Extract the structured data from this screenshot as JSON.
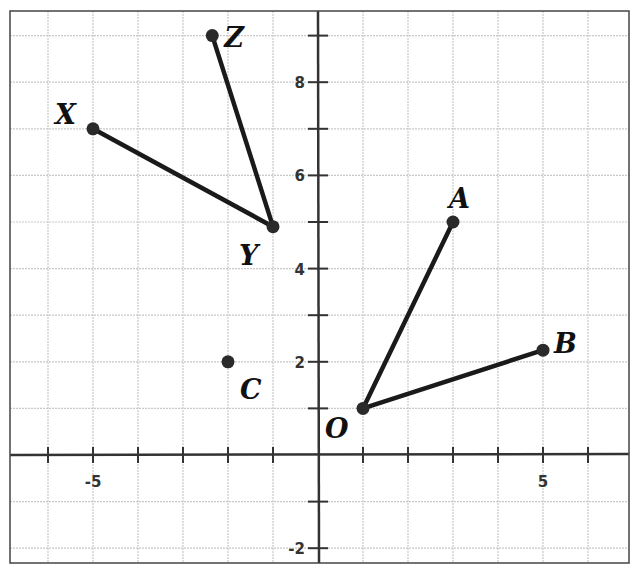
{
  "diagram": {
    "type": "coordinate-plane",
    "x_range": [
      -6.9,
      6.9
    ],
    "y_range": [
      -2.3,
      9.8
    ],
    "grid_step": 1,
    "axis_labels": {
      "x_ticks": [
        {
          "value": -5,
          "label": "-5"
        },
        {
          "value": 5,
          "label": "5"
        }
      ],
      "y_ticks": [
        {
          "value": 8,
          "label": "8"
        },
        {
          "value": 6,
          "label": "6"
        },
        {
          "value": 4,
          "label": "4"
        },
        {
          "value": 2,
          "label": "2"
        },
        {
          "value": -2,
          "label": "-2"
        }
      ]
    },
    "points": [
      {
        "name": "X",
        "x": -5,
        "y": 7
      },
      {
        "name": "Y",
        "x": -1,
        "y": 4.9
      },
      {
        "name": "Z",
        "x": -2.35,
        "y": 9
      },
      {
        "name": "C",
        "x": -2,
        "y": 2
      },
      {
        "name": "O",
        "x": 1,
        "y": 1
      },
      {
        "name": "A",
        "x": 3,
        "y": 5
      },
      {
        "name": "B",
        "x": 5,
        "y": 2.25
      }
    ],
    "segments": [
      {
        "from": "X",
        "to": "Y"
      },
      {
        "from": "Z",
        "to": "Y"
      },
      {
        "from": "O",
        "to": "A"
      },
      {
        "from": "O",
        "to": "B"
      }
    ],
    "colors": {
      "grid": "#c8c8c8",
      "axis": "#333333",
      "segment": "#1a1a1a",
      "point": "#2a2a2a",
      "border": "#444444"
    }
  }
}
